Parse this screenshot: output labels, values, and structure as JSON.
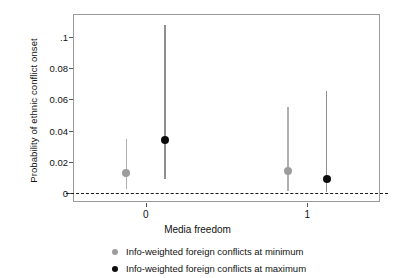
{
  "chart_data": {
    "type": "scatter",
    "title": "",
    "xlabel": "Media freedom",
    "ylabel": "Probability of ethnic conflict onset",
    "x_categories": [
      "0",
      "1"
    ],
    "xlim": [
      -0.45,
      1.45
    ],
    "ylim": [
      -0.006,
      0.115
    ],
    "yticks": [
      0,
      0.02,
      0.04,
      0.06,
      0.08,
      0.1
    ],
    "ytick_labels": [
      "0",
      "0.02",
      "0.04",
      "0.06",
      "0.08",
      ".1"
    ],
    "grid": false,
    "reference_line": {
      "y": 0,
      "style": "dashed",
      "color": "#1a1a1a"
    },
    "legend_position": "below",
    "series": [
      {
        "name": "Info-weighted foreign conflicts at minimum",
        "color": "#9d9d9d",
        "marker": "circle",
        "points": [
          {
            "x_label": "0",
            "x": -0.12,
            "y": 0.0129,
            "ci_low": 0.0025,
            "ci_high": 0.0344
          },
          {
            "x_label": "1",
            "x": 0.88,
            "y": 0.0141,
            "ci_low": 0.0012,
            "ci_high": 0.0552
          }
        ]
      },
      {
        "name": "Info-weighted foreign conflicts at maximum",
        "color": "#0d0d0d",
        "marker": "circle",
        "points": [
          {
            "x_label": "0",
            "x": 0.12,
            "y": 0.0337,
            "ci_low": 0.0086,
            "ci_high": 0.108
          },
          {
            "x_label": "1",
            "x": 1.12,
            "y": 0.0086,
            "ci_low": 0.0006,
            "ci_high": 0.0656
          }
        ]
      }
    ]
  },
  "axes": {
    "y_title": "Probability of ethnic conflict onset",
    "x_title": "Media freedom",
    "y_tick_labels": [
      "0",
      "0.02",
      "0.04",
      "0.06",
      "0.08",
      ".1"
    ],
    "x_tick_labels": [
      "0",
      "1"
    ]
  },
  "legend": {
    "entries": [
      {
        "label": "Info-weighted foreign conflicts at minimum",
        "color": "#9d9d9d"
      },
      {
        "label": "Info-weighted foreign conflicts at maximum",
        "color": "#0d0d0d"
      }
    ]
  }
}
